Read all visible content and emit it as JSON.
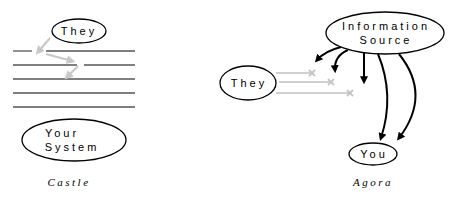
{
  "castle": {
    "caption": "Castle",
    "they_label": "They",
    "system_label_line1": "Your",
    "system_label_line2": "System"
  },
  "agora": {
    "caption": "Agora",
    "source_label_line1": "Information",
    "source_label_line2": "Source",
    "they_label": "They",
    "you_label": "You"
  },
  "colors": {
    "ink": "#000000",
    "wall": "#555555",
    "faded": "#c8c8c8"
  }
}
